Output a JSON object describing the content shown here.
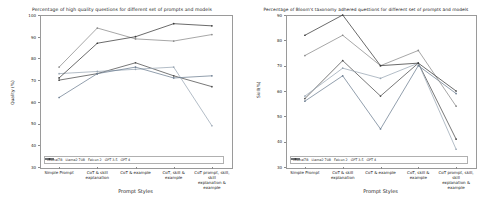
{
  "figure": {
    "xlabel": "Prompt Styles",
    "categories": [
      "Simple Prompt",
      "CoT & skill explanation",
      "CoT & example",
      "CoT, skill & example",
      "CoT prompt, skill, skill explanation & example"
    ],
    "category_lines": [
      [
        "Simple Prompt"
      ],
      [
        "CoT & skill",
        "explanation"
      ],
      [
        "CoT & example"
      ],
      [
        "CoT, skill &",
        "example"
      ],
      [
        "CoT prompt, skill, skill",
        "explanation & example"
      ]
    ],
    "series_names": [
      "Mistral7B",
      "Llama2 70B",
      "Falcon 2",
      "GPT 3.5",
      "GPT 4"
    ],
    "series_colors": [
      "#4b4b4b",
      "#9aa7b4",
      "#6e7f92",
      "#8a8a8a",
      "#3a3a3a"
    ]
  },
  "chart_data": [
    {
      "type": "line",
      "title": "Percentage of high quality questions for different set of prompts and models",
      "xlabel": "Prompt Styles",
      "ylabel": "Quality (%)",
      "ylim": [
        30,
        100
      ],
      "yticks": [
        30,
        40,
        50,
        60,
        70,
        80,
        90,
        100
      ],
      "grid": false,
      "legend_position": "lower center",
      "categories": [
        "Simple Prompt",
        "CoT & skill explanation",
        "CoT & example",
        "CoT, skill & example",
        "CoT prompt, skill, skill explanation & example"
      ],
      "series": [
        {
          "name": "Mistral7B",
          "values": [
            70,
            73,
            78,
            72,
            67
          ]
        },
        {
          "name": "Llama2 70B",
          "values": [
            73,
            74,
            75,
            76,
            49
          ]
        },
        {
          "name": "Falcon 2",
          "values": [
            62,
            73,
            76,
            71,
            72
          ]
        },
        {
          "name": "GPT 3.5",
          "values": [
            76,
            94,
            89,
            88,
            91
          ]
        },
        {
          "name": "GPT 4",
          "values": [
            71,
            87,
            90,
            96,
            95
          ]
        }
      ]
    },
    {
      "type": "line",
      "title": "Percentage of Bloom's taxonomy adhered questions for different set of prompts and models",
      "xlabel": "Prompt Styles",
      "ylabel": "Skill(%)",
      "ylim": [
        30,
        90
      ],
      "yticks": [
        30,
        40,
        50,
        60,
        70,
        80,
        90
      ],
      "grid": false,
      "legend_position": "lower center",
      "categories": [
        "Simple Prompt",
        "CoT & skill explanation",
        "CoT & example",
        "CoT, skill & example",
        "CoT prompt, skill, skill explanation & example"
      ],
      "series": [
        {
          "name": "Mistral7B",
          "values": [
            57,
            72,
            58,
            71,
            41
          ]
        },
        {
          "name": "Llama2 70B",
          "values": [
            58,
            69,
            65,
            71,
            37
          ]
        },
        {
          "name": "Falcon 2",
          "values": [
            56,
            66,
            45,
            70,
            59
          ]
        },
        {
          "name": "GPT 3.5",
          "values": [
            74,
            82,
            70,
            76,
            54
          ]
        },
        {
          "name": "GPT 4",
          "values": [
            82,
            90,
            70,
            71,
            60
          ]
        }
      ]
    }
  ]
}
